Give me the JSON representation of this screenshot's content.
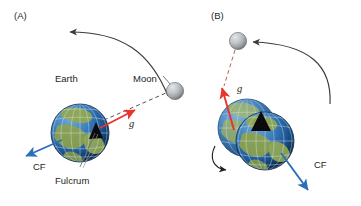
{
  "figure": {
    "background_color": "#ffffff",
    "width": 361,
    "height": 206
  },
  "panels": [
    {
      "id": "panel-a",
      "label": "(A)",
      "bodies": [
        {
          "name": "earth",
          "label": "Earth"
        },
        {
          "name": "moon",
          "label": "Moon"
        }
      ],
      "annotations": [
        {
          "name": "gravity-vector",
          "label": "g",
          "color": "#e8342a"
        },
        {
          "name": "centrifugal-vector",
          "label": "CF",
          "color": "#2b6fb8"
        },
        {
          "name": "fulcrum",
          "label": "Fulcrum",
          "color": "#000000"
        }
      ],
      "orbit_arrow": {
        "name": "orbit-direction-arrow",
        "color": "#3b3b3b"
      }
    },
    {
      "id": "panel-b",
      "label": "(B)",
      "bodies": [
        {
          "name": "earth",
          "label": ""
        },
        {
          "name": "moon",
          "label": ""
        }
      ],
      "annotations": [
        {
          "name": "gravity-vector",
          "label": "g",
          "color": "#e8342a"
        },
        {
          "name": "centrifugal-vector",
          "label": "CF",
          "color": "#2b6fb8"
        }
      ],
      "orbit_arrow": {
        "name": "orbit-direction-arrow",
        "color": "#3b3b3b"
      },
      "rotation_arrow": {
        "name": "earth-rotation-arrow",
        "color": "#231f20"
      }
    }
  ],
  "colors": {
    "gravity_red": "#e8342a",
    "centrifugal_blue": "#2b6fb8",
    "arrow_gray": "#3b3b3b",
    "text_dark": "#231f20",
    "moon_light": "#d2d4d6",
    "moon_mid": "#a8abae",
    "moon_dark": "#77797c",
    "ocean_light": "#3f7fbe",
    "ocean_dark": "#123a63",
    "land_green": "#8fa34a",
    "grid_white": "#cfe3f2"
  }
}
